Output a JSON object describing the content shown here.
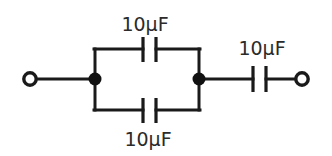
{
  "diagram": {
    "kind": "capacitor-network-schematic",
    "canvas": {
      "width": 332,
      "height": 156,
      "background": "#ffffff"
    },
    "ink_color": "#1a1a1a",
    "text_color": "#2b2b2b"
  },
  "labels": {
    "top_capacitor": "10μF",
    "bottom_capacitor": "10μF",
    "series_capacitor": "10μF"
  },
  "components": {
    "left_terminal": {
      "name": "left-terminal",
      "type": "open-terminal",
      "cx": 30,
      "cy": 79,
      "r": 7
    },
    "right_terminal": {
      "name": "right-terminal",
      "type": "open-terminal",
      "cx": 302,
      "cy": 79,
      "r": 7
    },
    "left_junction": {
      "name": "left-junction",
      "type": "node-dot",
      "cx": 95,
      "cy": 79,
      "r": 6
    },
    "right_junction": {
      "name": "right-junction",
      "type": "node-dot",
      "cx": 199,
      "cy": 79,
      "r": 6
    },
    "top_capacitor": {
      "name": "top-capacitor",
      "type": "capacitor",
      "plate_x_left": 143,
      "plate_x_right": 156,
      "y_top": 37,
      "y_bottom": 62,
      "rail_y": 49
    },
    "bottom_capacitor": {
      "name": "bottom-capacitor",
      "type": "capacitor",
      "plate_x_left": 143,
      "plate_x_right": 156,
      "y_top": 98,
      "y_bottom": 123,
      "rail_y": 110
    },
    "series_capacitor": {
      "name": "series-capacitor",
      "type": "capacitor",
      "plate_x_left": 253,
      "plate_x_right": 266,
      "y_top": 66,
      "y_bottom": 92,
      "rail_y": 79
    }
  },
  "label_positions": {
    "top": {
      "x": 145,
      "y": 31,
      "anchor": "middle"
    },
    "series": {
      "x": 262,
      "y": 55,
      "anchor": "middle"
    },
    "bottom": {
      "x": 148,
      "y": 146,
      "anchor": "middle"
    }
  }
}
